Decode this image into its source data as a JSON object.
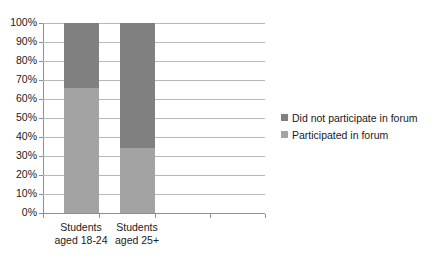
{
  "chart_data": {
    "type": "bar",
    "subtype": "100% stacked column",
    "title": "",
    "xlabel": "",
    "ylabel": "",
    "categories": [
      "Students aged 18-24",
      "Students aged 25+"
    ],
    "category_lines": [
      [
        "Students",
        "aged 18-24"
      ],
      [
        "Students",
        "aged 25+"
      ]
    ],
    "series": [
      {
        "name": "Did not participate in forum",
        "color": "#808080",
        "values": [
          34,
          66
        ]
      },
      {
        "name": "Participated in forum",
        "color": "#a3a3a3",
        "values": [
          66,
          34
        ]
      }
    ],
    "ylim": [
      0,
      100
    ],
    "ytick_labels": [
      "0%",
      "10%",
      "20%",
      "30%",
      "40%",
      "50%",
      "60%",
      "70%",
      "80%",
      "90%",
      "100%"
    ],
    "ytick_values": [
      0,
      10,
      20,
      30,
      40,
      50,
      60,
      70,
      80,
      90,
      100
    ],
    "grid": true,
    "grid_axis": "y",
    "legend_position": "right",
    "legend_entries": [
      "Did not participate in forum",
      "Participated in forum"
    ],
    "empty_category_slots": 2,
    "plot_background": "#ffffff"
  },
  "colors": {
    "series_dark": "#808080",
    "series_light": "#a3a3a3",
    "gridline": "#b8b8b8",
    "axis": "#8f8f8f",
    "text": "#1a1a1a",
    "background": "#ffffff"
  }
}
